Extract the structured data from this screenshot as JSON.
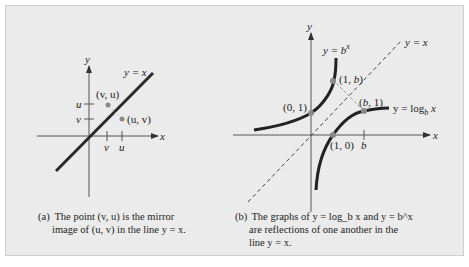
{
  "figure_a": {
    "axis_x_label": "x",
    "axis_y_label": "y",
    "line_label": "y = x",
    "tick_y_upper": "u",
    "tick_y_lower": "v",
    "tick_x_left": "v",
    "tick_x_right": "u",
    "point_mirror_label": "(v, u)",
    "point_original_label": "(u, v)",
    "caption_tag": "(a)",
    "caption_line1": "The point (v, u) is the mirror",
    "caption_line2": "image of (u, v) in the line y = x."
  },
  "figure_b": {
    "axis_x_label": "x",
    "axis_y_label": "y",
    "diagonal_label": "y = x",
    "exp_curve_label": "y = b",
    "exp_curve_sup": "x",
    "log_curve_label": "y = log",
    "log_curve_sub": "b",
    "log_curve_suffix": " x",
    "point_0_1": "(0, 1)",
    "point_1_b": "(1, b)",
    "point_b_1": "(b, 1)",
    "point_1_0": "(1, 0)",
    "tick_b": "b",
    "caption_tag": "(b)",
    "caption_line1": "The graphs of y = log_b x and y = b^x",
    "caption_line2": "are reflections of one another in the",
    "caption_line3": "line y = x."
  },
  "colors": {
    "panel_bg": "#ebebeb",
    "curve": "#222222",
    "point": "#8a8a8a"
  }
}
